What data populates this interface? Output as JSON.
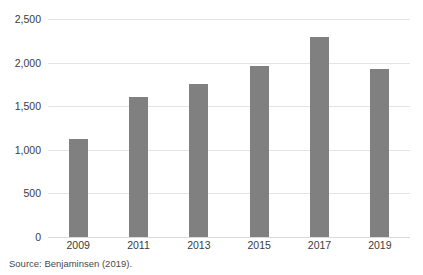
{
  "chart_data": {
    "type": "bar",
    "title": "",
    "subtitle": "",
    "xlabel": "",
    "ylabel": "",
    "categories": [
      "2009",
      "2011",
      "2013",
      "2015",
      "2017",
      "2019"
    ],
    "values": [
      1120,
      1600,
      1760,
      1960,
      2290,
      1930
    ],
    "series": [
      {
        "name": "",
        "values": [
          1120,
          1600,
          1760,
          1960,
          2290,
          1930
        ]
      }
    ],
    "ylim": [
      0,
      2500
    ],
    "ytick_values": [
      2500,
      2000,
      1500,
      1000,
      500,
      0
    ],
    "ytick_labels": [
      "2,500",
      "2,000",
      "1,500",
      "1,000",
      "500",
      "0"
    ],
    "xtick_labels": [
      "2009",
      "2011",
      "2013",
      "2015",
      "2017",
      "2019"
    ],
    "legend": [],
    "legend_position": "none",
    "grid": "horizontal",
    "bar_color": "#808080",
    "gridline_color": "#e4e4e4",
    "background_color": "#ffffff",
    "annotations": []
  },
  "caption": {
    "source_note": "Source: Benjaminsen (2019)."
  }
}
